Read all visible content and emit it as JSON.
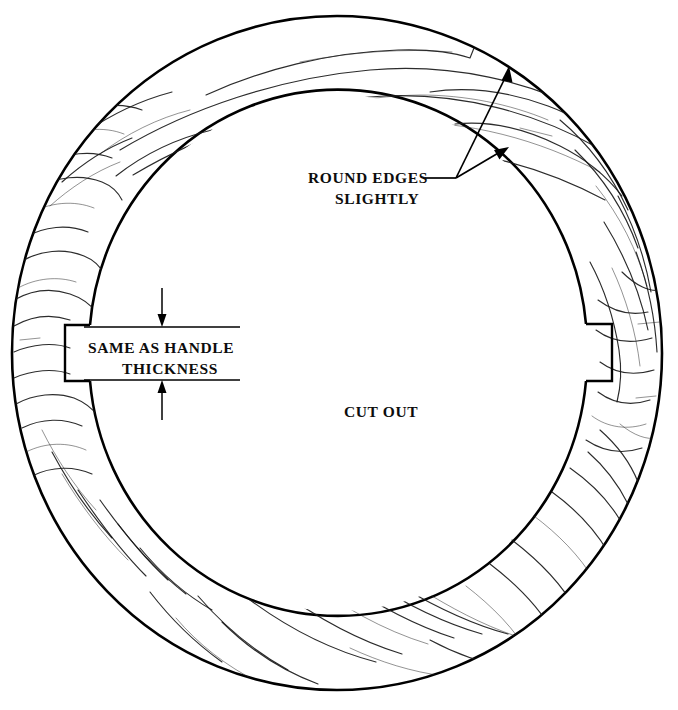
{
  "drawing": {
    "title": "Wooden Ring Cut-Out Pattern",
    "background_color": "#ffffff",
    "line_color": "#000000",
    "grain_color": "#1a1a1a"
  },
  "labels": {
    "round_edges_line1": "ROUND EDGES",
    "round_edges_line2": "SLIGHTLY",
    "handle_thickness_line1": "SAME AS HANDLE",
    "handle_thickness_line2": "THICKNESS",
    "cut_out": "CUT OUT"
  },
  "geometry": {
    "center_x": 337,
    "center_y": 353,
    "outer_radius_x": 325,
    "outer_radius_y": 337,
    "inner_radius_x": 249,
    "inner_radius_y": 258,
    "notch_left": {
      "outer_x": 65,
      "inner_x": 90,
      "top_y": 325,
      "bottom_y": 381
    },
    "notch_right": {
      "inner_x": 586,
      "outer_x": 612,
      "top_y": 324,
      "bottom_y": 381
    },
    "dimension_arrow_x": 162,
    "dimension_top_y": 327,
    "dimension_bottom_y": 380,
    "leader_origin_x": 455,
    "leader_origin_y": 178
  }
}
